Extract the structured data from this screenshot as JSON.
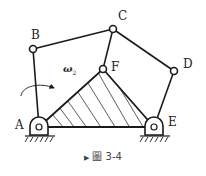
{
  "figure": {
    "caption_marker": "▶",
    "caption": "圖 3-4",
    "joints": {
      "A": {
        "label": "A",
        "x": 39,
        "y": 127
      },
      "B": {
        "label": "B",
        "x": 33,
        "y": 49
      },
      "C": {
        "label": "C",
        "x": 113,
        "y": 29
      },
      "D": {
        "label": "D",
        "x": 174,
        "y": 71
      },
      "E": {
        "label": "E",
        "x": 154,
        "y": 127
      },
      "F": {
        "label": "F",
        "x": 103,
        "y": 69
      }
    },
    "angular_velocity": {
      "symbol": "ω",
      "subscript": "2"
    },
    "links": [
      [
        "A",
        "B"
      ],
      [
        "B",
        "C"
      ],
      [
        "C",
        "F"
      ],
      [
        "C",
        "D"
      ],
      [
        "D",
        "E"
      ]
    ],
    "hatched_body": [
      "A",
      "F",
      "E"
    ],
    "colors": {
      "line": "#1a1a1a",
      "hatch": "#333333",
      "text": "#222222"
    }
  }
}
